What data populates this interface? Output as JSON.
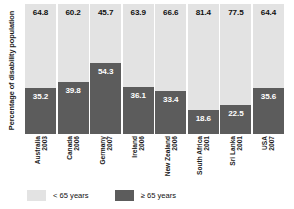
{
  "chart_data": {
    "type": "bar",
    "subtype": "stacked-100-percent",
    "title": "",
    "xlabel": "",
    "ylabel": "Percentage of disability population",
    "ylim": [
      0,
      100
    ],
    "grid": false,
    "legend_position": "bottom-left",
    "categories": [
      "Australia 2003",
      "Canada 2006",
      "Germany 2007",
      "Ireland 2006",
      "New Zealand 2006",
      "South Africa 2001",
      "Sri Lanka 2001",
      "USA 2007"
    ],
    "category_lines": [
      {
        "country": "Australia",
        "year": "2003"
      },
      {
        "country": "Canada",
        "year": "2006"
      },
      {
        "country": "Germany",
        "year": "2007"
      },
      {
        "country": "Ireland",
        "year": "2006"
      },
      {
        "country": "New Zealand",
        "year": "2006"
      },
      {
        "country": "South Africa",
        "year": "2001"
      },
      {
        "country": "Sri Lanka",
        "year": "2001"
      },
      {
        "country": "USA",
        "year": "2007"
      }
    ],
    "series": [
      {
        "name": "< 65 years",
        "color": "#e3e3e3",
        "values": [
          64.8,
          60.2,
          45.7,
          63.9,
          66.6,
          81.4,
          77.5,
          64.4
        ]
      },
      {
        "name": "≥ 65 years",
        "color": "#5c5c5c",
        "values": [
          35.2,
          39.8,
          54.3,
          36.1,
          33.4,
          18.6,
          22.5,
          35.6
        ]
      }
    ],
    "legend": [
      {
        "label": "< 65 years",
        "color": "#e3e3e3"
      },
      {
        "label": "≥ 65 years",
        "color": "#5c5c5c"
      }
    ]
  }
}
